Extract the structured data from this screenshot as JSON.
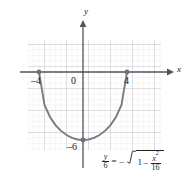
{
  "chart_data": {
    "type": "line",
    "title": "",
    "subtitle": "",
    "xlabel": "x",
    "ylabel": "y",
    "xlim": [
      -5.5,
      3.5
    ],
    "ylim": [
      -7.5,
      1.5
    ],
    "grid": true,
    "legend_position": "none",
    "equation_text": "y/6 = -sqrt(1 - x^2/16)",
    "curve_description": "lower half of an ellipse with x-intercepts at -4 and 4 and minimum at (0, -6)",
    "series": [
      {
        "name": "y/6 = -sqrt(1 - x^2/16)",
        "color": "#7a7a80",
        "x": [
          -4,
          -3.5,
          -3,
          -2.5,
          -2,
          -1.5,
          -1,
          -0.5,
          0,
          0.5,
          1,
          1.5,
          2,
          2.5,
          3,
          3.5,
          4
        ],
        "y": [
          0,
          -2.905,
          -3.969,
          -4.684,
          -5.196,
          -5.562,
          -5.809,
          -5.953,
          -6,
          -5.953,
          -5.809,
          -5.562,
          -5.196,
          -4.684,
          -3.969,
          -2.905,
          0
        ]
      }
    ],
    "marked_points": [
      {
        "label": "-4",
        "x": -4,
        "y": 0
      },
      {
        "label": "4",
        "x": 4,
        "y": 0
      },
      {
        "label": "-6",
        "x": 0,
        "y": -6
      }
    ],
    "axis_tick_labels": {
      "x": [
        "-4",
        "0",
        "4"
      ],
      "y": [
        "-6"
      ]
    }
  },
  "labels": {
    "x_axis": "x",
    "y_axis": "y",
    "origin": "0",
    "x_neg4": "–4",
    "x_pos4": "4",
    "y_neg6": "–6"
  },
  "equation": {
    "lhs_num": "y",
    "lhs_den": "6",
    "equals": "=",
    "minus": "–",
    "one": "1",
    "inner_minus": "–",
    "frac_num_var": "x",
    "frac_num_exp": "2",
    "frac_den": "16"
  },
  "colors": {
    "curve": "#7a7a80",
    "axis": "#4d4d55",
    "grid_major": "#b8b8bd",
    "grid_minor": "#d3d3d8",
    "point": "#70707a",
    "text": "#1a1a1a"
  }
}
